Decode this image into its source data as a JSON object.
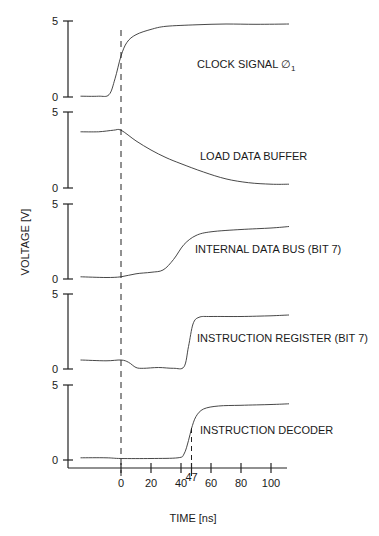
{
  "chart_data": {
    "type": "line",
    "title": "",
    "xlabel": "TIME [ns]",
    "ylabel": "VOLTAGE [V]",
    "xlim": [
      -27,
      112
    ],
    "x_ticks": [
      0,
      20,
      40,
      47,
      60,
      80,
      100
    ],
    "x_tick_labels": [
      "0",
      "20",
      "40",
      "47",
      "60",
      "80",
      "100"
    ],
    "markers": [
      {
        "x": 0,
        "style": "dashed",
        "span": "all panels"
      },
      {
        "x": 47,
        "style": "dashed",
        "span": "instruction decoder panel"
      }
    ],
    "grid": false,
    "panels": [
      {
        "name": "CLOCK SIGNAL Ø1",
        "label": "CLOCK SIGNAL ∅",
        "label_sub": "1",
        "ylim": [
          0,
          5
        ],
        "y_ticks": [
          "0",
          "5"
        ],
        "x": [
          -27,
          -15,
          -8,
          -4,
          0,
          4,
          10,
          20,
          30,
          50,
          70,
          90,
          112
        ],
        "values": [
          0.05,
          0.05,
          0.15,
          1.2,
          2.7,
          3.6,
          4.1,
          4.45,
          4.65,
          4.75,
          4.8,
          4.78,
          4.8
        ]
      },
      {
        "name": "LOAD DATA BUFFER",
        "label": "LOAD DATA BUFFER",
        "ylim": [
          0,
          5
        ],
        "y_ticks": [
          "0",
          "5"
        ],
        "x": [
          -27,
          -15,
          -5,
          0,
          10,
          20,
          30,
          40,
          55,
          70,
          85,
          100,
          112
        ],
        "values": [
          3.7,
          3.7,
          3.8,
          3.8,
          3.1,
          2.5,
          2.0,
          1.6,
          1.05,
          0.6,
          0.35,
          0.25,
          0.25
        ]
      },
      {
        "name": "INTERNAL DATA BUS (BIT 7)",
        "label": "INTERNAL DATA BUS (BIT 7)",
        "ylim": [
          0,
          5
        ],
        "y_ticks": [
          "0",
          "5"
        ],
        "x": [
          -27,
          -10,
          0,
          10,
          20,
          28,
          35,
          42,
          50,
          60,
          80,
          100,
          112
        ],
        "values": [
          0.15,
          0.1,
          0.15,
          0.35,
          0.45,
          0.6,
          1.3,
          2.3,
          2.9,
          3.15,
          3.3,
          3.4,
          3.5
        ]
      },
      {
        "name": "INSTRUCTION REGISTER (BIT 7)",
        "label": "INSTRUCTION REGISTER (BIT 7)",
        "ylim": [
          0,
          5
        ],
        "y_ticks": [
          "0",
          "5"
        ],
        "x": [
          -27,
          -10,
          0,
          5,
          10,
          15,
          25,
          35,
          42,
          45,
          48,
          52,
          60,
          80,
          100,
          112
        ],
        "values": [
          0.6,
          0.55,
          0.6,
          0.45,
          0.1,
          0.05,
          0.1,
          0.05,
          0.15,
          1.5,
          3.0,
          3.45,
          3.5,
          3.5,
          3.55,
          3.6
        ]
      },
      {
        "name": "INSTRUCTION DECODER",
        "label": "INSTRUCTION DECODER",
        "ylim": [
          0,
          5
        ],
        "y_ticks": [
          "0",
          "5"
        ],
        "x": [
          -27,
          -10,
          0,
          20,
          38,
          42,
          45,
          47,
          50,
          55,
          65,
          80,
          100,
          112
        ],
        "values": [
          0.15,
          0.15,
          0.1,
          0.1,
          0.15,
          0.4,
          1.3,
          2.1,
          2.9,
          3.4,
          3.6,
          3.65,
          3.7,
          3.75
        ]
      }
    ]
  },
  "axes": {
    "ylabel": "VOLTAGE [V]",
    "xlabel": "TIME [ns]"
  }
}
